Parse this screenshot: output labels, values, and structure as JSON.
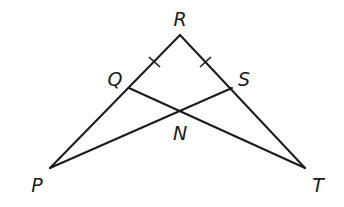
{
  "diagram": {
    "type": "geometry-triangle",
    "points": {
      "R": {
        "label": "R",
        "x": 180,
        "y": 35,
        "lx": 180,
        "ly": 20
      },
      "P": {
        "label": "P",
        "x": 50,
        "y": 168,
        "lx": 37,
        "ly": 188
      },
      "T": {
        "label": "T",
        "x": 305,
        "y": 168,
        "lx": 318,
        "ly": 188
      },
      "Q": {
        "label": "Q",
        "x": 129,
        "y": 88,
        "lx": 114,
        "ly": 82
      },
      "S": {
        "label": "S",
        "x": 232,
        "y": 88,
        "lx": 244,
        "ly": 82
      },
      "N": {
        "label": "N",
        "x": 180,
        "y": 111,
        "lx": 180,
        "ly": 137
      }
    },
    "segments": [
      "RP",
      "RT",
      "PS",
      "QT"
    ],
    "congruence_marks": [
      "RQ",
      "RS"
    ],
    "colors": {
      "stroke": "#1a1a1a",
      "background": "#ffffff"
    }
  }
}
